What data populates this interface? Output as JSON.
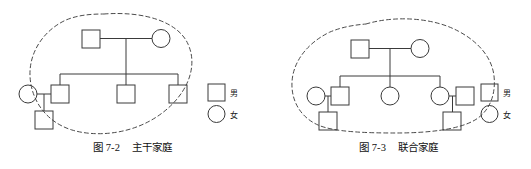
{
  "figure_sheet": {
    "background_color": "#ffffff",
    "line_color": "#3a3a3a",
    "boundary_color": "#4a4a4a"
  },
  "panels": [
    {
      "id": "stem-family",
      "caption": "图 7-2    主干家庭",
      "caption_number": "图 7-2",
      "caption_title": "主干家庭",
      "boundary_style": "dashed-oval",
      "legend": {
        "male_label": "男",
        "female_label": "女"
      },
      "nodes": [
        {
          "name": "grandfather",
          "shape": "square",
          "generation": 1,
          "label": ""
        },
        {
          "name": "grandmother",
          "shape": "circle",
          "generation": 1,
          "label": ""
        },
        {
          "name": "eldest-son",
          "shape": "square",
          "generation": 2,
          "label": ""
        },
        {
          "name": "eldest-son-wife",
          "shape": "circle",
          "generation": 2,
          "label": ""
        },
        {
          "name": "second-son",
          "shape": "square",
          "generation": 2,
          "label": ""
        },
        {
          "name": "third-son",
          "shape": "square",
          "generation": 2,
          "label": ""
        },
        {
          "name": "grandchild",
          "shape": "square",
          "generation": 3,
          "label": ""
        }
      ]
    },
    {
      "id": "joint-family",
      "caption": "图 7-3    联合家庭",
      "caption_number": "图 7-3",
      "caption_title": "联合家庭",
      "boundary_style": "dashed-blob",
      "legend": {
        "male_label": "男",
        "female_label": "女"
      },
      "nodes": [
        {
          "name": "grandfather",
          "shape": "square",
          "generation": 1,
          "label": ""
        },
        {
          "name": "grandmother",
          "shape": "circle",
          "generation": 1,
          "label": ""
        },
        {
          "name": "son-wife",
          "shape": "circle",
          "generation": 2,
          "label": ""
        },
        {
          "name": "son",
          "shape": "square",
          "generation": 2,
          "label": ""
        },
        {
          "name": "unmarried-daughter",
          "shape": "circle",
          "generation": 2,
          "label": ""
        },
        {
          "name": "daughter",
          "shape": "circle",
          "generation": 2,
          "label": ""
        },
        {
          "name": "daughter-husband",
          "shape": "square",
          "generation": 2,
          "label": ""
        },
        {
          "name": "grandchild-left",
          "shape": "square",
          "generation": 3,
          "label": ""
        },
        {
          "name": "grandchild-right",
          "shape": "square",
          "generation": 3,
          "label": ""
        }
      ]
    }
  ]
}
